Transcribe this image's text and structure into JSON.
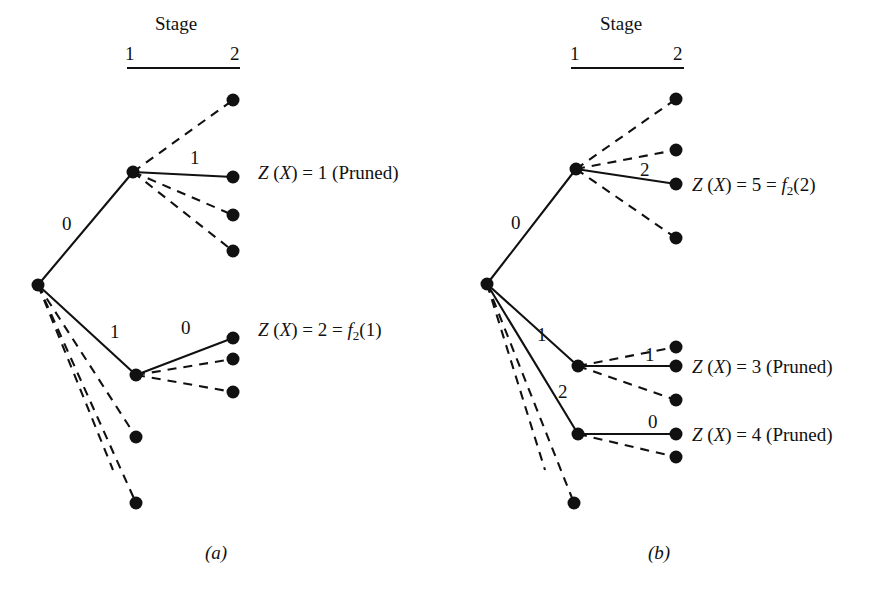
{
  "figure": {
    "title_absent": true,
    "background_color": "#ffffff",
    "ink_color": "#111111",
    "panels": [
      {
        "id": "a",
        "caption": "(a)",
        "caption_x": 205,
        "caption_y": 543,
        "stage_header": {
          "title": "Stage",
          "title_x": 155,
          "title_y": 14,
          "tick_left": "1",
          "tick_left_x": 125,
          "tick_left_y": 44,
          "tick_right": "2",
          "tick_right_x": 230,
          "tick_right_y": 44,
          "rule_x1": 127,
          "rule_x2": 240,
          "rule_y": 68
        },
        "nodes": [
          {
            "name": "root",
            "x": 38,
            "y": 285,
            "r": 6.5
          },
          {
            "name": "stage1-upper",
            "x": 133,
            "y": 172,
            "r": 6.5
          },
          {
            "name": "stage1-lower",
            "x": 136,
            "y": 375,
            "r": 6.5
          },
          {
            "name": "leaf-u1",
            "x": 233,
            "y": 100,
            "r": 6.5
          },
          {
            "name": "leaf-u2",
            "x": 233,
            "y": 177,
            "r": 6.5
          },
          {
            "name": "leaf-u3",
            "x": 233,
            "y": 215,
            "r": 6.5
          },
          {
            "name": "leaf-u4",
            "x": 233,
            "y": 251,
            "r": 6.5
          },
          {
            "name": "leaf-l1",
            "x": 233,
            "y": 338,
            "r": 6.5
          },
          {
            "name": "leaf-l2",
            "x": 233,
            "y": 359,
            "r": 6.5
          },
          {
            "name": "leaf-l3",
            "x": 233,
            "y": 392,
            "r": 6.5
          },
          {
            "name": "root-dashed-leaf-1",
            "x": 136,
            "y": 437,
            "r": 6.5
          },
          {
            "name": "root-dashed-leaf-2",
            "x": 136,
            "y": 503,
            "r": 6.5
          }
        ],
        "edges": [
          {
            "name": "root-to-stage1-upper",
            "style": "solid",
            "x1": 38,
            "y1": 285,
            "x2": 133,
            "y2": 172
          },
          {
            "name": "root-to-stage1-lower",
            "style": "solid",
            "x1": 38,
            "y1": 285,
            "x2": 136,
            "y2": 375
          },
          {
            "name": "root-dashed-a",
            "style": "dashed",
            "x1": 38,
            "y1": 285,
            "x2": 136,
            "y2": 437
          },
          {
            "name": "root-dashed-b",
            "style": "dashed",
            "x1": 38,
            "y1": 285,
            "x2": 136,
            "y2": 503
          },
          {
            "name": "root-dashed-c",
            "style": "dashed",
            "x1": 38,
            "y1": 285,
            "x2": 113,
            "y2": 470
          },
          {
            "name": "upper-dashed-1",
            "style": "dashed",
            "x1": 133,
            "y1": 172,
            "x2": 233,
            "y2": 100
          },
          {
            "name": "upper-solid-1",
            "style": "solid",
            "x1": 133,
            "y1": 172,
            "x2": 233,
            "y2": 177
          },
          {
            "name": "upper-dashed-2",
            "style": "dashed",
            "x1": 133,
            "y1": 172,
            "x2": 233,
            "y2": 215
          },
          {
            "name": "upper-dashed-3",
            "style": "dashed",
            "x1": 133,
            "y1": 172,
            "x2": 233,
            "y2": 251
          },
          {
            "name": "lower-solid-1",
            "style": "solid",
            "x1": 136,
            "y1": 375,
            "x2": 233,
            "y2": 338
          },
          {
            "name": "lower-dashed-1",
            "style": "dashed",
            "x1": 136,
            "y1": 375,
            "x2": 233,
            "y2": 359
          },
          {
            "name": "lower-dashed-2",
            "style": "dashed",
            "x1": 136,
            "y1": 375,
            "x2": 233,
            "y2": 392
          }
        ],
        "edge_labels": [
          {
            "name": "edge-label-root-upper",
            "text": "0",
            "x": 62,
            "y": 214
          },
          {
            "name": "edge-label-root-lower",
            "text": "1",
            "x": 110,
            "y": 322
          },
          {
            "name": "edge-label-upper-solid",
            "text": "1",
            "x": 190,
            "y": 148
          },
          {
            "name": "edge-label-lower-solid",
            "text": "0",
            "x": 181,
            "y": 318
          }
        ],
        "results": [
          {
            "name": "result-upper",
            "x": 258,
            "y": 163,
            "z_symbol": "Z",
            "arg": "(X)",
            "equals": " = ",
            "value": "1",
            "suffix": " (Pruned)",
            "has_f": false
          },
          {
            "name": "result-lower",
            "x": 258,
            "y": 320,
            "z_symbol": "Z",
            "arg": "(X)",
            "equals": " = ",
            "value": "2",
            "suffix": "",
            "has_f": true,
            "f_symbol": "f",
            "f_subscript": "2",
            "f_arg": "(1)"
          }
        ]
      },
      {
        "id": "b",
        "caption": "(b)",
        "caption_x": 648,
        "caption_y": 543,
        "stage_header": {
          "title": "Stage",
          "title_x": 600,
          "title_y": 14,
          "tick_left": "1",
          "tick_left_x": 570,
          "tick_left_y": 44,
          "tick_right": "2",
          "tick_right_x": 673,
          "tick_right_y": 44,
          "rule_x1": 571,
          "rule_x2": 684,
          "rule_y": 68
        },
        "nodes": [
          {
            "name": "root",
            "x": 487,
            "y": 284,
            "r": 6.5
          },
          {
            "name": "stage1-upper",
            "x": 576,
            "y": 169,
            "r": 6.5
          },
          {
            "name": "stage1-middle",
            "x": 578,
            "y": 366,
            "r": 6.5
          },
          {
            "name": "stage1-lower",
            "x": 578,
            "y": 434,
            "r": 6.5
          },
          {
            "name": "leaf-u1",
            "x": 676,
            "y": 99,
            "r": 6.5
          },
          {
            "name": "leaf-u2",
            "x": 676,
            "y": 150,
            "r": 6.5
          },
          {
            "name": "leaf-u3",
            "x": 676,
            "y": 184,
            "r": 6.5
          },
          {
            "name": "leaf-u4",
            "x": 676,
            "y": 238,
            "r": 6.5
          },
          {
            "name": "leaf-m1",
            "x": 676,
            "y": 347,
            "r": 6.5
          },
          {
            "name": "leaf-m2",
            "x": 676,
            "y": 366,
            "r": 6.5
          },
          {
            "name": "leaf-m3",
            "x": 676,
            "y": 400,
            "r": 6.5
          },
          {
            "name": "leaf-l1",
            "x": 676,
            "y": 434,
            "r": 6.5
          },
          {
            "name": "leaf-l2",
            "x": 676,
            "y": 457,
            "r": 6.5
          },
          {
            "name": "root-dashed-leaf-1",
            "x": 574,
            "y": 503,
            "r": 6.5
          }
        ],
        "edges": [
          {
            "name": "root-to-stage1-upper",
            "style": "solid",
            "x1": 487,
            "y1": 284,
            "x2": 576,
            "y2": 169
          },
          {
            "name": "root-to-stage1-middle",
            "style": "solid",
            "x1": 487,
            "y1": 284,
            "x2": 578,
            "y2": 366
          },
          {
            "name": "root-to-stage1-lower",
            "style": "solid",
            "x1": 487,
            "y1": 284,
            "x2": 578,
            "y2": 434
          },
          {
            "name": "root-dashed-a",
            "style": "dashed",
            "x1": 487,
            "y1": 284,
            "x2": 574,
            "y2": 503
          },
          {
            "name": "root-dashed-b",
            "style": "dashed",
            "x1": 487,
            "y1": 284,
            "x2": 545,
            "y2": 470
          },
          {
            "name": "upper-dashed-1",
            "style": "dashed",
            "x1": 576,
            "y1": 169,
            "x2": 676,
            "y2": 99
          },
          {
            "name": "upper-dashed-2",
            "style": "dashed",
            "x1": 576,
            "y1": 169,
            "x2": 676,
            "y2": 150
          },
          {
            "name": "upper-solid-1",
            "style": "solid",
            "x1": 576,
            "y1": 169,
            "x2": 676,
            "y2": 184
          },
          {
            "name": "upper-dashed-3",
            "style": "dashed",
            "x1": 576,
            "y1": 169,
            "x2": 676,
            "y2": 238
          },
          {
            "name": "middle-dashed-1",
            "style": "dashed",
            "x1": 578,
            "y1": 366,
            "x2": 676,
            "y2": 347
          },
          {
            "name": "middle-solid-1",
            "style": "solid",
            "x1": 578,
            "y1": 366,
            "x2": 676,
            "y2": 366
          },
          {
            "name": "middle-dashed-2",
            "style": "dashed",
            "x1": 578,
            "y1": 366,
            "x2": 676,
            "y2": 400
          },
          {
            "name": "lower-solid-1",
            "style": "solid",
            "x1": 578,
            "y1": 434,
            "x2": 676,
            "y2": 434
          },
          {
            "name": "lower-dashed-1",
            "style": "dashed",
            "x1": 578,
            "y1": 434,
            "x2": 676,
            "y2": 457
          }
        ],
        "edge_labels": [
          {
            "name": "edge-label-root-upper",
            "text": "0",
            "x": 511,
            "y": 213
          },
          {
            "name": "edge-label-root-middle",
            "text": "1",
            "x": 537,
            "y": 325
          },
          {
            "name": "edge-label-root-lower",
            "text": "2",
            "x": 558,
            "y": 382
          },
          {
            "name": "edge-label-upper-solid",
            "text": "2",
            "x": 640,
            "y": 160
          },
          {
            "name": "edge-label-middle-solid",
            "text": "1",
            "x": 645,
            "y": 345
          },
          {
            "name": "edge-label-lower-solid",
            "text": "0",
            "x": 648,
            "y": 412
          }
        ],
        "results": [
          {
            "name": "result-upper",
            "x": 692,
            "y": 175,
            "z_symbol": "Z",
            "arg": "(X)",
            "equals": " = ",
            "value": "5",
            "suffix": "",
            "has_f": true,
            "f_symbol": "f",
            "f_subscript": "2",
            "f_arg": "(2)"
          },
          {
            "name": "result-middle",
            "x": 692,
            "y": 357,
            "z_symbol": "Z",
            "arg": "(X)",
            "equals": " = ",
            "value": "3",
            "suffix": " (Pruned)",
            "has_f": false
          },
          {
            "name": "result-lower",
            "x": 692,
            "y": 425,
            "z_symbol": "Z",
            "arg": "(X)",
            "equals": " = ",
            "value": "4",
            "suffix": " (Pruned)",
            "has_f": false
          }
        ]
      }
    ]
  }
}
